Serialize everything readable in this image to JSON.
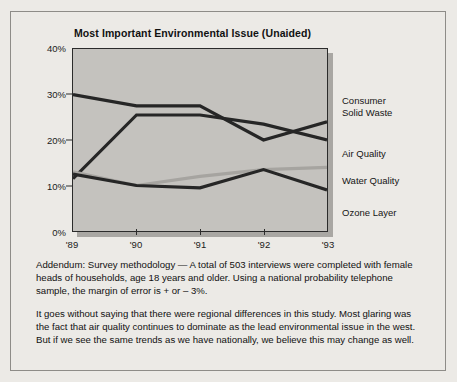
{
  "chart_data": {
    "type": "line",
    "title": "Most Important Environmental Issue (Unaided)",
    "xlabel": "",
    "ylabel": "",
    "categories": [
      "'89",
      "'90",
      "'91",
      "'92",
      "'93"
    ],
    "ylim": [
      0,
      40
    ],
    "ytick_labels": [
      "40%",
      "30%",
      "20%",
      "10%",
      "0%"
    ],
    "ytick_values": [
      40,
      30,
      20,
      10,
      0
    ],
    "grid": false,
    "legend_position": "right",
    "series": [
      {
        "name": "Consumer Solid Waste",
        "color": "#262626",
        "values": [
          30,
          27.5,
          27.5,
          20,
          24
        ]
      },
      {
        "name": "Air Quality",
        "color": "#262626",
        "values": [
          11.5,
          25.5,
          25.5,
          23.5,
          20
        ]
      },
      {
        "name": "Water Quality",
        "color": "#a6a4a0",
        "values": [
          13,
          10,
          12,
          13.5,
          14
        ]
      },
      {
        "name": "Ozone Layer",
        "color": "#262626",
        "values": [
          12.5,
          10,
          9.5,
          13.5,
          9
        ]
      }
    ]
  },
  "legend": {
    "items": [
      {
        "label": "Consumer\nSolid Waste"
      },
      {
        "label": "Air Quality"
      },
      {
        "label": "Water Quality"
      },
      {
        "label": "Ozone Layer"
      }
    ]
  },
  "addendum": {
    "text": "Addendum: Survey methodology — A total of 503 interviews were completed with female heads of households, age 18 years and older. Using a national probability telephone sample, the margin of error is + or – 3%."
  },
  "commentary": {
    "text": "It goes without saying that there were regional differences in this study. Most glaring was the fact that air quality continues to dominate as the lead environmental issue in the west. But if we see the same trends as we have nationally, we believe this may change as well."
  }
}
